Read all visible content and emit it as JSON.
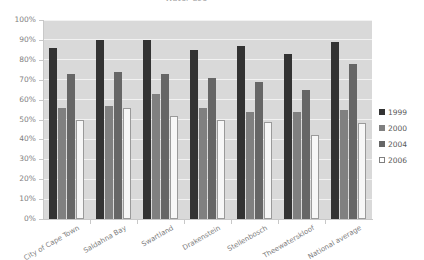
{
  "chart_data": {
    "type": "bar",
    "title": "Water use",
    "xlabel": "",
    "ylabel": "",
    "ylim": [
      0,
      100
    ],
    "ytick_labels": [
      "100%",
      "90%",
      "80%",
      "70%",
      "60%",
      "50%",
      "40%",
      "30%",
      "20%",
      "10%",
      "0%"
    ],
    "ytick_values": [
      100,
      90,
      80,
      70,
      60,
      50,
      40,
      30,
      20,
      10,
      0
    ],
    "grid": true,
    "legend_position": "right",
    "categories": [
      "City of Cape Town",
      "Saldahna Bay",
      "Swartland",
      "Drakenstein",
      "Stellenbosch",
      "Theewaterskloof",
      "National average"
    ],
    "series": [
      {
        "name": "1999",
        "color": "#333333",
        "values": [
          86,
          90,
          90,
          85,
          87,
          83,
          89
        ]
      },
      {
        "name": "2000",
        "color": "#808080",
        "values": [
          56,
          57,
          63,
          56,
          54,
          54,
          55
        ]
      },
      {
        "name": "2004",
        "color": "#666666",
        "values": [
          73,
          74,
          73,
          71,
          69,
          65,
          78
        ]
      },
      {
        "name": "2006",
        "color": "#ffffff",
        "values": [
          50,
          56,
          52,
          50,
          49,
          42,
          48
        ]
      }
    ]
  },
  "legend": {
    "items": [
      {
        "label": "1999"
      },
      {
        "label": "2000"
      },
      {
        "label": "2004"
      },
      {
        "label": "2006"
      }
    ]
  }
}
